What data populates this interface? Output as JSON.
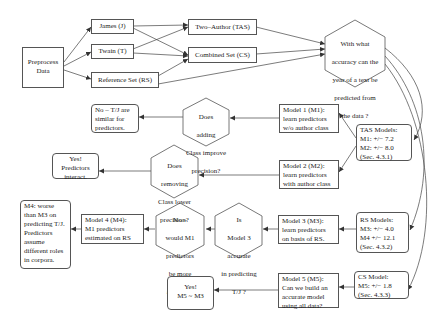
{
  "diagram": {
    "preprocess": {
      "lines": [
        "Preprocess",
        "Data"
      ]
    },
    "james": {
      "label": "James (J)"
    },
    "twain": {
      "label": "Twain (T)"
    },
    "reference": {
      "label": "Reference Set (RS)"
    },
    "two_author": {
      "label": "Two–Author (TAS)"
    },
    "combined": {
      "label": "Combined Set (CS)"
    },
    "question_main": {
      "lines": [
        "With what",
        "accuracy can the",
        "year of a text be",
        "predicted from",
        "the data ?"
      ]
    },
    "model1": {
      "lines": [
        "Model 1 (M1):",
        "learn predictors",
        "w/o author class"
      ]
    },
    "tas_models": {
      "lines": [
        "TAS Models:",
        "M1: +/− 7.2",
        "M2: +/− 8.0",
        "(Sec. 4.3.1)"
      ]
    },
    "model2": {
      "lines": [
        "Model 2 (M2):",
        "learn predictors",
        "with author class"
      ]
    },
    "q_adding": {
      "lines": [
        "Does",
        "adding",
        "Class improve",
        "precision?"
      ]
    },
    "no_similar": {
      "lines": [
        "No – T/J are",
        "similar for",
        "predictors."
      ]
    },
    "q_removing": {
      "lines": [
        "Does",
        "removing",
        "Class lower",
        "precision?"
      ]
    },
    "yes_interact": {
      "lines": [
        "Yes!",
        "Predictors",
        "interact."
      ]
    },
    "rs_models": {
      "lines": [
        "RS Models:",
        "M3: +/− 4.0",
        "M4 +/− 12.1",
        "(Sec. 4.3.2)"
      ]
    },
    "model3": {
      "lines": [
        "Model 3 (M3):",
        "learn predictors",
        "on basis of RS."
      ]
    },
    "q_model3": {
      "lines": [
        "Is",
        "Model 3",
        "accurate",
        "in predicting",
        "T/J ?"
      ]
    },
    "q_m1": {
      "lines": [
        "No –",
        "would M1",
        "predictors",
        "be more",
        "accurate?"
      ]
    },
    "model4": {
      "lines": [
        "Model 4 (M4):",
        "M1 predictors",
        "estimated on RS"
      ]
    },
    "m4_worse": {
      "lines": [
        "M4: worse",
        "than M3 on",
        "predicting T/J.",
        "Predictors",
        "assume",
        "different roles",
        "in corpora."
      ]
    },
    "cs_model": {
      "lines": [
        "CS Model:",
        "M5: +/− 1.8",
        "(Sec. 4.3.3)"
      ]
    },
    "model5": {
      "lines": [
        "Model 5 (M5):",
        "Can we build an",
        "accurate model",
        "using all data?"
      ]
    },
    "yes_m5": {
      "lines": [
        "Yes!",
        "M5 ~ M3"
      ]
    }
  },
  "colors": {
    "stroke": "#555555",
    "text": "#222222",
    "background": "#ffffff"
  }
}
